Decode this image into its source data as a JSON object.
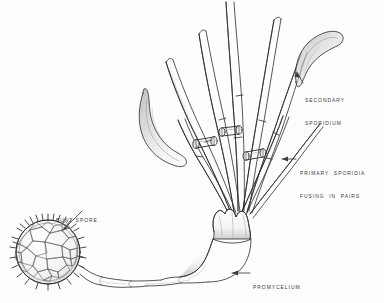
{
  "figure": {
    "medium": "pen-and-ink line drawing",
    "background_color": "#fdfdfd",
    "ink_color": "#2b2b2b",
    "label_color": "#3a3a3a",
    "shade_color": "#9a9a9a"
  },
  "labels": [
    {
      "id": "secondary-sporidium",
      "line1": "SECONDARY",
      "line2": "SPORIDIUM",
      "x": 305,
      "y": 84,
      "leader": "arrow-up-left"
    },
    {
      "id": "primary-sporidia",
      "line1": "PRIMARY  SPORIDIA",
      "line2": "FUSING  IN  PAIRS",
      "x": 300,
      "y": 157,
      "leader": "arrow-left"
    },
    {
      "id": "bunt-spore",
      "line1": "BUNT SPORE",
      "line2": "",
      "x": 56,
      "y": 203,
      "leader": "arrow-down-left"
    },
    {
      "id": "promycelium",
      "line1": "PROMYCELIUM",
      "line2": "",
      "x": 253,
      "y": 271,
      "leader": "arrow-left"
    }
  ],
  "structures": {
    "bunt_spore": {
      "name": "bunt spore",
      "shape": "spiny reticulate sphere",
      "center_x": 48,
      "center_y": 252,
      "radius": 33,
      "spine_count": 30,
      "cell_count": 27
    },
    "promycelium": {
      "name": "promycelium",
      "shape": "segmented hyphal tube",
      "segments": 4,
      "from_x": 76,
      "from_y": 258,
      "to_x": 232,
      "to_y": 236
    },
    "apex": {
      "name": "promycelium apex crown",
      "x": 232,
      "y": 215
    },
    "primary_sporidia": {
      "name": "primary sporidia",
      "count": 8,
      "shape": "long tapering filaments",
      "fusion_bridges": 3,
      "bridge_form": "H-shaped conjugation tube"
    },
    "secondary_sporidia": [
      {
        "id": "right",
        "shape": "curved sickle",
        "x": 318,
        "y": 52
      },
      {
        "id": "left",
        "shape": "curved sickle",
        "x": 150,
        "y": 118
      }
    ]
  }
}
